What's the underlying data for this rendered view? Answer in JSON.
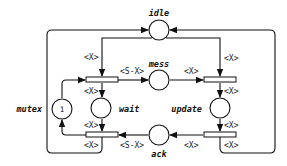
{
  "diagram": {
    "type": "petri-net",
    "places": {
      "idle": {
        "label": "idle"
      },
      "mess": {
        "label": "mess"
      },
      "ack": {
        "label": "ack"
      },
      "wait": {
        "label": "wait"
      },
      "update": {
        "label": "update"
      },
      "mutex": {
        "label": "mutex",
        "tokens": "1"
      }
    },
    "arcs": {
      "idle_to_left_top": "<X>",
      "idle_to_right_top": "<X>",
      "left_top_to_mess": "<S-X>",
      "mess_to_right_top": "<X>",
      "left_top_to_wait": "<X>",
      "right_top_to_update": "<X>",
      "wait_to_left_bottom": "<X>",
      "update_to_right_bottom": "<X>",
      "right_bottom_to_ack": "<X>",
      "ack_to_left_bottom": "<S-X>",
      "left_bottom_to_idle": "<X>",
      "right_bottom_to_idle": "<X>"
    }
  }
}
